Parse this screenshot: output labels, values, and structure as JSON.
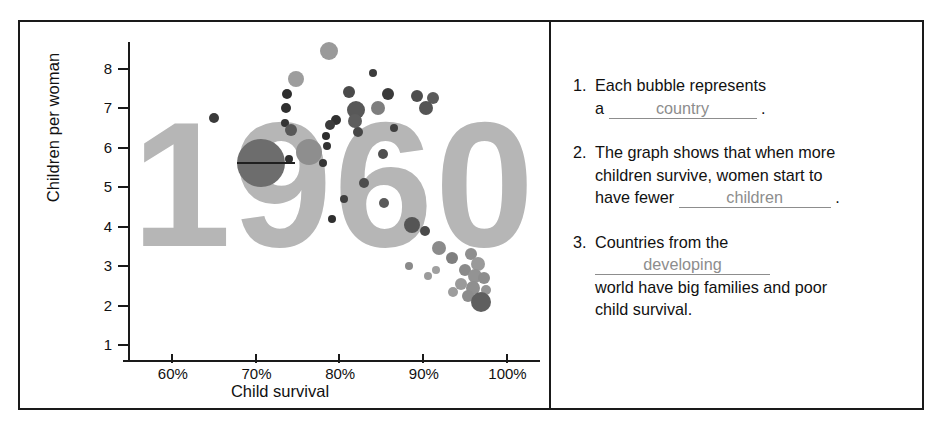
{
  "chart_data": {
    "type": "scatter",
    "title": "1960",
    "xlabel": "Child survival",
    "ylabel": "Children per woman",
    "xlim": [
      55,
      104
    ],
    "ylim": [
      0.6,
      8.7
    ],
    "grid": false,
    "legend": "none",
    "xticks": [
      "60%",
      "70%",
      "80%",
      "90%",
      "100%"
    ],
    "xtick_values": [
      60,
      70,
      80,
      90,
      100
    ],
    "yticks": [
      "1",
      "2",
      "3",
      "4",
      "5",
      "6",
      "7",
      "8"
    ],
    "ytick_values": [
      1,
      2,
      3,
      4,
      5,
      6,
      7,
      8
    ],
    "watermark": "1960",
    "annotation": "horizontal median line drawn through the largest bubble at about 70% child survival and 5.6 children per woman",
    "points": [
      {
        "x": 78.8,
        "y": 8.45,
        "size": 9,
        "color": "#9a9a9a"
      },
      {
        "x": 74.8,
        "y": 7.75,
        "size": 8,
        "color": "#9d9d9d"
      },
      {
        "x": 84.1,
        "y": 7.88,
        "size": 4,
        "color": "#3c3c3c"
      },
      {
        "x": 73.8,
        "y": 7.35,
        "size": 5,
        "color": "#2e2e2e"
      },
      {
        "x": 81.2,
        "y": 7.4,
        "size": 6,
        "color": "#4a4a4a"
      },
      {
        "x": 85.8,
        "y": 7.35,
        "size": 6,
        "color": "#3a3a3a"
      },
      {
        "x": 89.3,
        "y": 7.3,
        "size": 6,
        "color": "#4e4e4e"
      },
      {
        "x": 91.2,
        "y": 7.25,
        "size": 6,
        "color": "#5b5b5b"
      },
      {
        "x": 73.7,
        "y": 7.0,
        "size": 5,
        "color": "#2f2f2f"
      },
      {
        "x": 82.0,
        "y": 6.95,
        "size": 9,
        "color": "#585858"
      },
      {
        "x": 84.6,
        "y": 7.0,
        "size": 7,
        "color": "#7e7e7e"
      },
      {
        "x": 90.4,
        "y": 7.0,
        "size": 7,
        "color": "#555555"
      },
      {
        "x": 65.0,
        "y": 6.75,
        "size": 5,
        "color": "#3a3a3a"
      },
      {
        "x": 73.5,
        "y": 6.62,
        "size": 4,
        "color": "#343434"
      },
      {
        "x": 79.6,
        "y": 6.7,
        "size": 5,
        "color": "#303030"
      },
      {
        "x": 81.9,
        "y": 6.68,
        "size": 7,
        "color": "#5d5d5d"
      },
      {
        "x": 78.9,
        "y": 6.58,
        "size": 5,
        "color": "#3b3b3b"
      },
      {
        "x": 82.3,
        "y": 6.4,
        "size": 5,
        "color": "#474747"
      },
      {
        "x": 74.2,
        "y": 6.45,
        "size": 6,
        "color": "#585858"
      },
      {
        "x": 78.4,
        "y": 6.3,
        "size": 4,
        "color": "#2d2d2d"
      },
      {
        "x": 86.6,
        "y": 6.5,
        "size": 4,
        "color": "#3f3f3f"
      },
      {
        "x": 78.6,
        "y": 6.05,
        "size": 4,
        "color": "#333333"
      },
      {
        "x": 70.2,
        "y": 5.75,
        "size": 4,
        "color": "#2b2b2b"
      },
      {
        "x": 74.0,
        "y": 5.72,
        "size": 4,
        "color": "#2e2e2e"
      },
      {
        "x": 85.2,
        "y": 5.85,
        "size": 5,
        "color": "#4f4f4f"
      },
      {
        "x": 70.6,
        "y": 5.6,
        "size": 24,
        "color": "#6d6d6d"
      },
      {
        "x": 78.1,
        "y": 5.6,
        "size": 4,
        "color": "#353535"
      },
      {
        "x": 76.4,
        "y": 5.9,
        "size": 13,
        "color": "#8e8e8e"
      },
      {
        "x": 83.0,
        "y": 5.1,
        "size": 5,
        "color": "#4c4c4c"
      },
      {
        "x": 85.3,
        "y": 4.6,
        "size": 5,
        "color": "#5a5a5a"
      },
      {
        "x": 80.6,
        "y": 4.7,
        "size": 4,
        "color": "#3f3f3f"
      },
      {
        "x": 79.1,
        "y": 4.2,
        "size": 4,
        "color": "#2f2f2f"
      },
      {
        "x": 88.7,
        "y": 4.05,
        "size": 8,
        "color": "#555555"
      },
      {
        "x": 90.2,
        "y": 3.9,
        "size": 5,
        "color": "#4a4a4a"
      },
      {
        "x": 91.9,
        "y": 3.45,
        "size": 7,
        "color": "#8b8b8b"
      },
      {
        "x": 93.5,
        "y": 3.2,
        "size": 6,
        "color": "#7f7f7f"
      },
      {
        "x": 95.7,
        "y": 3.3,
        "size": 6,
        "color": "#8f8f8f"
      },
      {
        "x": 96.6,
        "y": 3.05,
        "size": 7,
        "color": "#9a9a9a"
      },
      {
        "x": 95.0,
        "y": 2.9,
        "size": 6,
        "color": "#8a8a8a"
      },
      {
        "x": 96.2,
        "y": 2.75,
        "size": 7,
        "color": "#939393"
      },
      {
        "x": 97.3,
        "y": 2.7,
        "size": 6,
        "color": "#8d8d8d"
      },
      {
        "x": 94.6,
        "y": 2.55,
        "size": 6,
        "color": "#9a9a9a"
      },
      {
        "x": 96.0,
        "y": 2.45,
        "size": 7,
        "color": "#8f8f8f"
      },
      {
        "x": 97.6,
        "y": 2.4,
        "size": 5,
        "color": "#959595"
      },
      {
        "x": 95.4,
        "y": 2.25,
        "size": 6,
        "color": "#8c8c8c"
      },
      {
        "x": 96.9,
        "y": 2.1,
        "size": 10,
        "color": "#5f5f5f"
      },
      {
        "x": 93.6,
        "y": 2.35,
        "size": 5,
        "color": "#9d9d9d"
      },
      {
        "x": 91.6,
        "y": 2.9,
        "size": 4,
        "color": "#a0a0a0"
      },
      {
        "x": 88.4,
        "y": 3.0,
        "size": 4,
        "color": "#8a8a8a"
      },
      {
        "x": 90.6,
        "y": 2.75,
        "size": 4,
        "color": "#9b9b9b"
      }
    ]
  },
  "questions": [
    {
      "num": "1.",
      "line1": "Each bubble represents",
      "line2_before": "a",
      "answer": "country",
      "line2_after": "."
    },
    {
      "num": "2.",
      "line1": "The graph shows that when more",
      "line2": "children survive, women start to",
      "line3_before": "have fewer",
      "answer": "children",
      "line3_after": "."
    },
    {
      "num": "3.",
      "line1_before": "Countries from the",
      "answer": "developing",
      "line2": "world have big families and poor",
      "line3": "child survival."
    }
  ],
  "colors": {
    "frame": "#1a1a1a",
    "watermark": "#b6b6b6",
    "answer_ink": "#8d8d8d",
    "text": "#111111"
  }
}
